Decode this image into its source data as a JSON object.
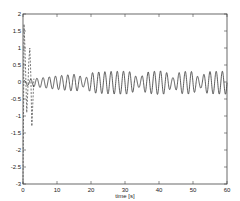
{
  "chart_data": {
    "type": "line",
    "title": "",
    "xlabel": "time [s]",
    "ylabel": "",
    "xlim": [
      0,
      60
    ],
    "ylim": [
      -3,
      2
    ],
    "grid": false,
    "legend": null,
    "x_ticks": [
      0,
      10,
      20,
      30,
      40,
      50,
      60
    ],
    "x_tick_labels": [
      "0",
      "10",
      "20",
      "30",
      "40",
      "50",
      "60"
    ],
    "y_ticks": [
      2,
      1.5,
      1,
      0.5,
      0,
      -0.5,
      -1,
      -1.5,
      -2,
      -2.5,
      -3
    ],
    "y_tick_labels": [
      "2",
      "1.5",
      "1",
      "0.5",
      "0",
      "-0.5",
      "-1",
      "-1.5",
      "-2",
      "-2.5",
      "-3"
    ],
    "series": [
      {
        "name": "dashed transient",
        "style": "dashed",
        "color": "#555555",
        "x": [
          0,
          0.15,
          0.3,
          0.5,
          0.8,
          1.1,
          1.4,
          1.7,
          2.0,
          2.3,
          2.6,
          2.9,
          3.2
        ],
        "y": [
          -3.0,
          -1.0,
          1.7,
          1.2,
          0.2,
          -0.9,
          -0.3,
          0.6,
          1.0,
          0.2,
          -1.3,
          -0.6,
          0.1
        ]
      },
      {
        "name": "solid response",
        "style": "solid",
        "color": "#333333",
        "frequency_hz": 0.55,
        "amplitude_profile": {
          "t": [
            0,
            3,
            6,
            10,
            15,
            20,
            25,
            30,
            35,
            40,
            45,
            50,
            55,
            60
          ],
          "amp": [
            0.05,
            0.12,
            0.15,
            0.2,
            0.25,
            0.3,
            0.33,
            0.34,
            0.3,
            0.35,
            0.32,
            0.34,
            0.33,
            0.34
          ]
        },
        "offset": -0.02,
        "beat_dips_t": [
          18,
          34,
          44,
          52
        ]
      }
    ]
  },
  "plot_box": {
    "left": 23,
    "right": 227,
    "top": 14,
    "bottom": 184
  }
}
